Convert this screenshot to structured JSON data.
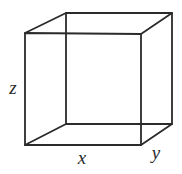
{
  "figure": {
    "type": "line-diagram",
    "shape": "cube",
    "background_color": "#ffffff",
    "line_color": "#2b2b2b",
    "line_width": 1.8,
    "canvas": {
      "width": 182,
      "height": 174
    }
  },
  "labels": {
    "x": {
      "text": "x",
      "x": 82,
      "y": 160,
      "style": "italic"
    },
    "y": {
      "text": "y",
      "x": 156,
      "y": 155,
      "style": "italic"
    },
    "z": {
      "text": "z",
      "x": 13,
      "y": 90,
      "style": "italic"
    }
  },
  "geometry": {
    "front_face": {
      "name": "front-square",
      "points": "25,33 141,34 141,145 25,145"
    },
    "back_face": {
      "name": "back-square",
      "points": "66,13 172,13 172,124 66,124"
    },
    "connectors": [
      {
        "name": "connector-top-left",
        "x1": 25,
        "y1": 33,
        "x2": 66,
        "y2": 13
      },
      {
        "name": "connector-top-right",
        "x1": 141,
        "y1": 34,
        "x2": 172,
        "y2": 13
      },
      {
        "name": "connector-bottom-right",
        "x1": 141,
        "y1": 145,
        "x2": 172,
        "y2": 124
      },
      {
        "name": "connector-bottom-left",
        "x1": 25,
        "y1": 145,
        "x2": 66,
        "y2": 124
      }
    ]
  }
}
